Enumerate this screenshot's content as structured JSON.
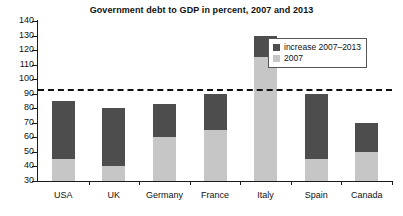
{
  "chart_data": {
    "type": "bar",
    "stacked": true,
    "title": "Government debt to GDP in percent, 2007 and 2013",
    "xlabel": "",
    "ylabel": "",
    "ylim": [
      30,
      140
    ],
    "ytick_step": 10,
    "yticks": [
      140,
      130,
      120,
      110,
      100,
      90,
      80,
      70,
      60,
      50,
      40,
      30
    ],
    "grid": false,
    "legend_position": "top-right",
    "categories": [
      "USA",
      "UK",
      "Germany",
      "France",
      "Italy",
      "Spain",
      "Canada"
    ],
    "series": [
      {
        "name": "2007",
        "color": "#c6c6c6",
        "values": [
          45,
          40,
          60,
          65,
          115,
          45,
          50
        ]
      },
      {
        "name": "increase 2007–2013",
        "color": "#4d4d4d",
        "values": [
          40,
          40,
          23,
          25,
          15,
          45,
          20
        ]
      }
    ],
    "totals_2013": [
      85,
      80,
      83,
      90,
      130,
      90,
      70
    ],
    "annotations": [
      {
        "type": "hline",
        "value": 93,
        "style": "dashed",
        "color": "#111111"
      }
    ]
  },
  "legend": {
    "entries": [
      {
        "label": "increase 2007–2013",
        "color": "#4d4d4d"
      },
      {
        "label": "2007",
        "color": "#c6c6c6"
      }
    ]
  }
}
